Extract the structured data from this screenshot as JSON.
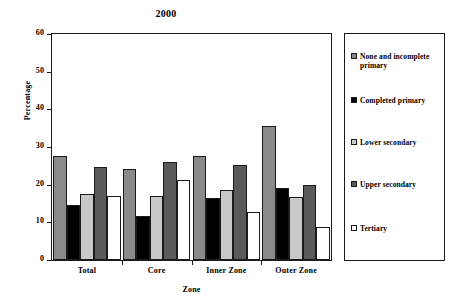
{
  "chart_data": {
    "type": "bar",
    "title": "2000",
    "xlabel": "Zone",
    "ylabel": "Percentage",
    "ylim": [
      0,
      60
    ],
    "yticks": [
      0,
      10,
      20,
      30,
      40,
      50,
      60
    ],
    "grid": false,
    "legend_position": "right",
    "categories": [
      "Total",
      "Core",
      "Inner Zone",
      "Outer Zone"
    ],
    "series": [
      {
        "name": "None and incomplete primary",
        "color": "#8a8a8a",
        "values": [
          27.5,
          24.2,
          27.5,
          35.7
        ]
      },
      {
        "name": "Completed primary",
        "color": "#000000",
        "values": [
          14.5,
          11.8,
          16.4,
          19.0
        ]
      },
      {
        "name": "Lower secondary",
        "color": "#c8c8c8",
        "values": [
          17.5,
          17.0,
          18.5,
          16.7
        ]
      },
      {
        "name": "Upper secondary",
        "color": "#5a5a5a",
        "values": [
          24.8,
          26.1,
          25.1,
          20.0
        ]
      },
      {
        "name": "Tertiary",
        "color": "#ffffff",
        "values": [
          16.9,
          21.2,
          12.8,
          8.7
        ]
      }
    ]
  },
  "legend": {
    "items": [
      {
        "label": "None and incomplete primary",
        "swatch": "sw-none"
      },
      {
        "label": "Completed primary",
        "swatch": "sw-compl"
      },
      {
        "label": "Lower secondary",
        "swatch": "sw-lower"
      },
      {
        "label": "Upper secondary",
        "swatch": "sw-upper"
      },
      {
        "label": "Tertiary",
        "swatch": "sw-tert"
      }
    ]
  }
}
